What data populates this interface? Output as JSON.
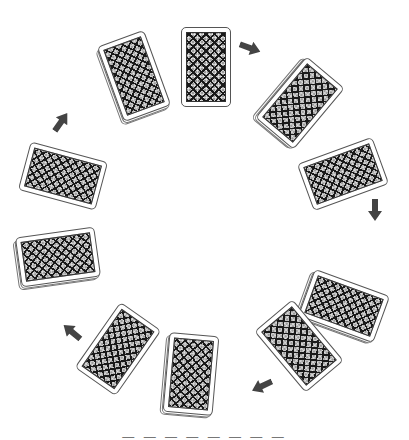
{
  "diagram": {
    "title": "",
    "colors": {
      "card_border": "#555555",
      "pattern_dark": "#1a1a1a",
      "pattern_mid": "#9a9a9a",
      "arrow": "#444444",
      "background": "#ffffff"
    },
    "cards": [
      {
        "id": 1,
        "x": 206,
        "y": 67,
        "w": 50,
        "h": 80,
        "rot": 0,
        "stacked": false
      },
      {
        "id": 2,
        "x": 134,
        "y": 76,
        "w": 50,
        "h": 80,
        "rot": -20,
        "stacked": true
      },
      {
        "id": 3,
        "x": 300,
        "y": 103,
        "w": 50,
        "h": 80,
        "rot": 40,
        "stacked": true
      },
      {
        "id": 4,
        "x": 343,
        "y": 174,
        "w": 80,
        "h": 50,
        "rot": -20,
        "stacked": false
      },
      {
        "id": 5,
        "x": 344,
        "y": 306,
        "w": 80,
        "h": 50,
        "rot": 20,
        "stacked": true
      },
      {
        "id": 6,
        "x": 299,
        "y": 346,
        "w": 50,
        "h": 80,
        "rot": -40,
        "stacked": false
      },
      {
        "id": 7,
        "x": 191,
        "y": 374,
        "w": 50,
        "h": 80,
        "rot": 5,
        "stacked": true
      },
      {
        "id": 8,
        "x": 118,
        "y": 349,
        "w": 50,
        "h": 80,
        "rot": 35,
        "stacked": false
      },
      {
        "id": 9,
        "x": 58,
        "y": 257,
        "w": 80,
        "h": 50,
        "rot": -8,
        "stacked": true
      },
      {
        "id": 10,
        "x": 63,
        "y": 176,
        "w": 80,
        "h": 50,
        "rot": 15,
        "stacked": false
      }
    ],
    "arrows": [
      {
        "id": "arrow-1",
        "x": 250,
        "y": 48,
        "rot": 20
      },
      {
        "id": "arrow-2",
        "x": 375,
        "y": 210,
        "rot": 90
      },
      {
        "id": "arrow-3",
        "x": 262,
        "y": 386,
        "rot": 155
      },
      {
        "id": "arrow-4",
        "x": 72,
        "y": 332,
        "rot": -140
      },
      {
        "id": "arrow-5",
        "x": 61,
        "y": 122,
        "rot": -55
      }
    ],
    "caption": "— — — — — — — —"
  }
}
